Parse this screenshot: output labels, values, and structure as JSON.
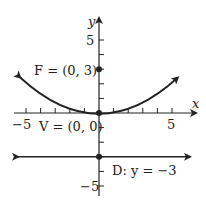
{
  "figure": {
    "type": "parabola-diagram",
    "axes": {
      "x_label": "x",
      "y_label": "y",
      "x_ticks": [
        -5,
        5
      ],
      "y_ticks": [
        5,
        -5
      ],
      "tick_labels": {
        "x_neg5": "−5",
        "x_pos5": "5",
        "y_pos5": "5",
        "y_neg5": "−5"
      },
      "range": {
        "x": [
          -6,
          6
        ],
        "y": [
          -7,
          7
        ]
      }
    },
    "points": {
      "focus": {
        "label": "F = (0, 3)",
        "x": 0,
        "y": 3
      },
      "vertex": {
        "label": "V = (0, 0)",
        "x": 0,
        "y": 0
      },
      "directrix_point": {
        "x": 0,
        "y": -3
      }
    },
    "directrix": {
      "label": "D: y = −3",
      "y": -3
    },
    "curve": {
      "equation": "x^2 = 12y",
      "x_range": [
        -5.5,
        5.5
      ]
    },
    "colors": {
      "ink": "#222222",
      "background": "#ffffff"
    }
  }
}
